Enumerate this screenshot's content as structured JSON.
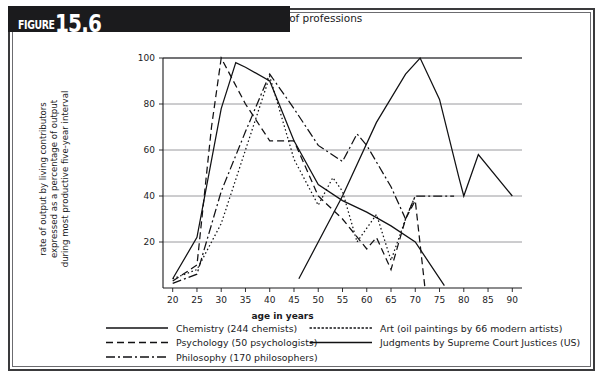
{
  "figure": {
    "word": "FIGURE",
    "number": "15.6",
    "caption": "Age and achievement in a variety of professions"
  },
  "chart_data": {
    "type": "line",
    "title": "Age and achievement in a variety of professions",
    "xlabel": "age in years",
    "ylabel": "rate of output by living contributors expressed as a percentage of output during most productive five-year interval",
    "ylabel_lines": [
      "rate of output by living contributors",
      "expressed as a percentage of output",
      "during most productive five-year interval"
    ],
    "xlim": [
      18,
      92
    ],
    "ylim": [
      0,
      100
    ],
    "xticks": [
      20,
      25,
      30,
      35,
      40,
      45,
      50,
      55,
      60,
      65,
      70,
      75,
      80,
      85,
      90
    ],
    "yticks": [
      20,
      40,
      60,
      80,
      100
    ],
    "grid": "horizontal",
    "legend_position": "below-plot",
    "series": [
      {
        "name": "Chemistry (244 chemists)",
        "style": "solid",
        "dasharray": "none",
        "x": [
          20,
          25,
          30,
          33,
          35,
          40,
          45,
          50,
          55,
          60,
          65,
          70,
          76
        ],
        "y": [
          4,
          22,
          78,
          98,
          96,
          90,
          64,
          45,
          38,
          33,
          27,
          20,
          1
        ]
      },
      {
        "name": "Psychology (50 psychologists)",
        "style": "dashed",
        "dasharray": "7,4",
        "x": [
          20,
          25,
          28,
          30,
          35,
          40,
          45,
          50,
          55,
          60,
          62,
          65,
          68,
          70,
          72
        ],
        "y": [
          3,
          10,
          70,
          100,
          80,
          64,
          64,
          40,
          30,
          17,
          22,
          8,
          30,
          38,
          0
        ]
      },
      {
        "name": "Philosophy (170 philosophers)",
        "style": "dashdot",
        "dasharray": "9,3,2,3",
        "x": [
          20,
          25,
          30,
          35,
          40,
          45,
          50,
          55,
          58,
          60,
          65,
          68,
          70,
          78
        ],
        "y": [
          2,
          6,
          42,
          68,
          93,
          78,
          62,
          55,
          67,
          62,
          44,
          30,
          40,
          40
        ]
      },
      {
        "name": "Art (oil paintings by 66 modern artists)",
        "style": "dotted",
        "dasharray": "1.5,2.5",
        "x": [
          20,
          25,
          30,
          35,
          40,
          45,
          50,
          53,
          55,
          58,
          62,
          65,
          68,
          70
        ],
        "y": [
          4,
          8,
          28,
          60,
          92,
          56,
          36,
          48,
          42,
          20,
          32,
          12,
          30,
          40
        ]
      },
      {
        "name": "Judgments by Supreme Court Justices (US)",
        "style": "solid",
        "dasharray": "none",
        "x": [
          46,
          55,
          62,
          68,
          71,
          75,
          79,
          80,
          83,
          90
        ],
        "y": [
          4,
          40,
          72,
          93,
          100,
          82,
          48,
          40,
          58,
          40
        ]
      }
    ]
  },
  "legend": {
    "column_left": [
      {
        "label": "Chemistry (244 chemists)",
        "style": "solid"
      },
      {
        "label": "Psychology (50 psychologists)",
        "style": "dashed"
      },
      {
        "label": "Philosophy (170 philosophers)",
        "style": "dashdot"
      }
    ],
    "column_right": [
      {
        "label": "Art (oil paintings by 66 modern artists)",
        "style": "dotted"
      },
      {
        "label": "Judgments by Supreme Court Justices (US)",
        "style": "solid"
      }
    ]
  },
  "colors": {
    "ink": "#1b1b1d",
    "grid": "#8e8e93",
    "frame": "#3a3a3c",
    "header_bar": "#1b1b1d",
    "header_text": "#ffffff",
    "background": "#ffffff"
  }
}
